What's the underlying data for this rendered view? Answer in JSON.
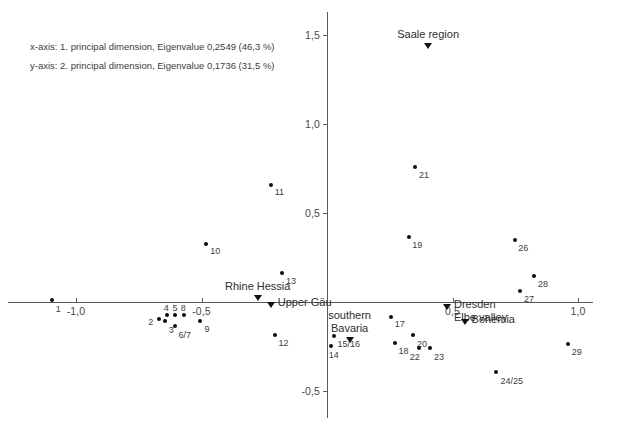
{
  "chart_data": {
    "type": "scatter",
    "title": "",
    "subtitle": "",
    "xlabel": "1. principal dimension",
    "ylabel": "2. principal dimension",
    "xlim": [
      -1.1,
      1.12
    ],
    "ylim": [
      -0.62,
      1.62
    ],
    "grid": false,
    "legend_position": "top-left",
    "annotations": [
      "x-axis: 1. principal dimension, Eigenvalue 0,2549 (46,3 %)",
      "y-axis: 2. principal dimension, Eigenvalue 0,1736 (31,5 %)"
    ],
    "xticks": [
      {
        "value": -1.0,
        "label": "-1,0"
      },
      {
        "value": -0.5,
        "label": "-0,5"
      },
      {
        "value": 0.5,
        "label": "0,5"
      },
      {
        "value": 1.0,
        "label": "1,0"
      }
    ],
    "yticks": [
      {
        "value": 1.5,
        "label": "1,5"
      },
      {
        "value": 1.0,
        "label": "1,0"
      },
      {
        "value": 0.5,
        "label": "0,5"
      },
      {
        "value": -0.5,
        "label": "-0,5"
      }
    ],
    "series": [
      {
        "name": "samples",
        "marker": "dot",
        "color": "#0d0d0d",
        "points": [
          {
            "label": "1",
            "x": -1.097,
            "y": 0.012,
            "lx": 4,
            "ly": 4
          },
          {
            "label": "2",
            "x": -0.668,
            "y": -0.097,
            "lx": -11,
            "ly": -2
          },
          {
            "label": "3",
            "x": -0.646,
            "y": -0.104,
            "lx": 4,
            "ly": 4
          },
          {
            "label": "4",
            "x": -0.638,
            "y": -0.075,
            "lx": -3,
            "ly": -12
          },
          {
            "label": "5",
            "x": -0.604,
            "y": -0.075,
            "lx": -3,
            "ly": -12
          },
          {
            "label": "8",
            "x": -0.571,
            "y": -0.075,
            "lx": -3,
            "ly": -12
          },
          {
            "label": "6/7",
            "x": -0.604,
            "y": -0.134,
            "lx": 3,
            "ly": 4
          },
          {
            "label": "9",
            "x": -0.504,
            "y": -0.104,
            "lx": 4,
            "ly": 3
          },
          {
            "label": "10",
            "x": -0.481,
            "y": 0.328,
            "lx": 4,
            "ly": 2
          },
          {
            "label": "11",
            "x": -0.224,
            "y": 0.66,
            "lx": 4,
            "ly": 2
          },
          {
            "label": "12",
            "x": -0.209,
            "y": -0.187,
            "lx": 4,
            "ly": 3
          },
          {
            "label": "13",
            "x": -0.179,
            "y": 0.164,
            "lx": 4,
            "ly": 3
          },
          {
            "label": "14",
            "x": 0.015,
            "y": -0.246,
            "lx": -2,
            "ly": 4
          },
          {
            "label": "15/16",
            "x": 0.026,
            "y": -0.19,
            "lx": 4,
            "ly": 3
          },
          {
            "label": "17",
            "x": 0.254,
            "y": -0.086,
            "lx": 4,
            "ly": 2
          },
          {
            "label": "18",
            "x": 0.269,
            "y": -0.231,
            "lx": 4,
            "ly": 3
          },
          {
            "label": "20",
            "x": 0.343,
            "y": -0.183,
            "lx": 4,
            "ly": 4
          },
          {
            "label": "22",
            "x": 0.366,
            "y": -0.261,
            "lx": -9,
            "ly": 4
          },
          {
            "label": "23",
            "x": 0.41,
            "y": -0.257,
            "lx": 4,
            "ly": 4
          },
          {
            "label": "19",
            "x": 0.328,
            "y": 0.366,
            "lx": 3,
            "ly": 3
          },
          {
            "label": "21",
            "x": 0.351,
            "y": 0.757,
            "lx": 4,
            "ly": 3
          },
          {
            "label": "24/25",
            "x": 0.675,
            "y": -0.396,
            "lx": 4,
            "ly": 4
          },
          {
            "label": "26",
            "x": 0.75,
            "y": 0.351,
            "lx": 3,
            "ly": 3
          },
          {
            "label": "27",
            "x": 0.769,
            "y": 0.063,
            "lx": 4,
            "ly": 3
          },
          {
            "label": "28",
            "x": 0.825,
            "y": 0.146,
            "lx": 4,
            "ly": 3
          },
          {
            "label": "29",
            "x": 0.959,
            "y": -0.235,
            "lx": 4,
            "ly": 3
          }
        ]
      },
      {
        "name": "region-centroids",
        "marker": "triangle-down",
        "color": "#111111",
        "points": [
          {
            "label": "Rhine Hessia",
            "x": -0.276,
            "y": 0.02,
            "label_pos": "above",
            "lines": [
              "Rhine Hessia"
            ]
          },
          {
            "label": "Upper Gäu",
            "x": -0.224,
            "y": -0.015,
            "label_pos": "right",
            "lines": [
              "Upper Gäu"
            ]
          },
          {
            "label": "Saale region",
            "x": 0.403,
            "y": 1.438,
            "label_pos": "above",
            "lines": [
              "Saale region"
            ]
          },
          {
            "label": "southern Bavaria",
            "x": 0.09,
            "y": -0.216,
            "label_pos": "above",
            "lines": [
              "southern",
              "Bavaria"
            ]
          },
          {
            "label": "Dresden Elbe valley",
            "x": 0.478,
            "y": -0.03,
            "label_pos": "right",
            "lines": [
              "Dresden",
              "Elbe valley"
            ]
          },
          {
            "label": "Bohemia",
            "x": 0.548,
            "y": -0.112,
            "label_pos": "right",
            "lines": [
              "Bohemia"
            ]
          }
        ]
      }
    ]
  },
  "legend": {
    "line1": "x-axis: 1. principal dimension, Eigenvalue 0,2549 (46,3 %)",
    "line2": "y-axis: 2. principal dimension, Eigenvalue 0,1736 (31,5 %)"
  },
  "group_labels": {
    "rhine_hessia": "Rhine Hessia",
    "upper_gau": "Upper Gäu",
    "saale_region": "Saale region",
    "southern_bavaria_l1": "southern",
    "southern_bavaria_l2": "Bavaria",
    "dresden_l1": "Dresden",
    "dresden_l2": "Elbe valley",
    "bohemia": "Bohemia"
  },
  "colors": {
    "axis": "#5a5a5a",
    "point": "#0d0d0d",
    "text": "#3d3d3d",
    "background": "#ffffff"
  }
}
